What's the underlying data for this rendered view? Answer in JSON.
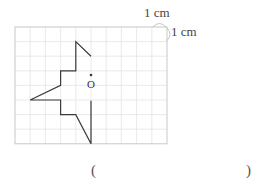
{
  "diagram": {
    "scale_label_horizontal": "1 cm",
    "scale_label_vertical": "1 cm",
    "center_label": "O",
    "grid": {
      "columns": 10,
      "rows": 8,
      "origin_x": 15,
      "origin_y": 27,
      "cell_w": 15.2,
      "cell_h": 14.6,
      "line_color": "#e4e4e4",
      "border_color": "#c8c8c8"
    },
    "shape_color": "#3a3a3a",
    "shape_points_grid": [
      [
        5,
        2.0
      ],
      [
        4,
        1
      ],
      [
        4,
        3
      ],
      [
        3,
        3
      ],
      [
        3,
        4
      ],
      [
        1,
        5
      ],
      [
        3,
        5
      ],
      [
        3,
        6
      ],
      [
        4,
        6
      ],
      [
        5,
        8
      ],
      [
        5,
        5.05
      ]
    ],
    "center_point_grid": [
      5,
      3.9
    ]
  },
  "answer": {
    "open_paren": "(",
    "close_paren": ")"
  }
}
